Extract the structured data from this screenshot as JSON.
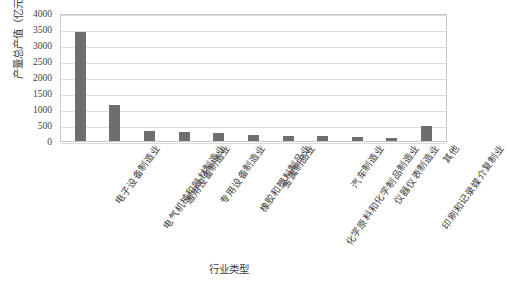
{
  "chart_data": {
    "type": "bar",
    "title": "",
    "xlabel": "行业类型",
    "ylabel": "产量总产值（亿元）",
    "ylim": [
      0,
      4000
    ],
    "ytick_step": 500,
    "yticks": [
      "0",
      "500",
      "1000",
      "1500",
      "2000",
      "2500",
      "3000",
      "3500",
      "4000"
    ],
    "grid": true,
    "legend": "none",
    "bar_color": "#6e6e6e",
    "gridline_color": "#dcdcdc",
    "categories": [
      "电子设备制造业",
      "电气机械和器材制造业",
      "通用设备制造业",
      "专用设备制造业",
      "橡胶和塑料制品业",
      "金属制品业",
      "化学原料和化学制品制造业",
      "汽车制造业",
      "仪器仪表制造业",
      "印刷和记录媒介复制业",
      "其他"
    ],
    "values": [
      3420,
      1130,
      300,
      290,
      260,
      200,
      165,
      145,
      130,
      105,
      455
    ]
  }
}
